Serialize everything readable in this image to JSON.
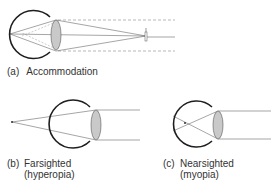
{
  "panels": [
    {
      "id": "a",
      "tag": "(a)",
      "label": "Accommodation",
      "sublabel": "",
      "eye": {
        "cx": 34,
        "cy": 34,
        "r": 24
      },
      "lens": {
        "cx": 56,
        "cy": 35,
        "rx": 5,
        "ry": 15
      },
      "focus_point": {
        "x": 10,
        "y": 34
      },
      "object_point": {
        "x": 146,
        "y": 34
      },
      "description": "Rays from a near object converge on the retina; dashed lines show parallel rays from a distant object"
    },
    {
      "id": "b",
      "tag": "(b)",
      "label": "Farsighted",
      "sublabel": "(hyperopia)",
      "eye": {
        "cx": 73,
        "cy": 124,
        "r": 24
      },
      "lens": {
        "cx": 96,
        "cy": 125,
        "rx": 5,
        "ry": 15
      },
      "focus_point": {
        "x": 12,
        "y": 122
      },
      "description": "Parallel rays focus behind the retina"
    },
    {
      "id": "c",
      "tag": "(c)",
      "label": "Nearsighted",
      "sublabel": "(myopia)",
      "eye": {
        "cx": 195,
        "cy": 124,
        "r": 23
      },
      "lens": {
        "cx": 218,
        "cy": 125,
        "rx": 5,
        "ry": 14
      },
      "focus_point": {
        "x": 185,
        "y": 123
      },
      "description": "Parallel rays focus in front of the retina"
    }
  ],
  "colors": {
    "eye_outline": "#1e1e1e",
    "lens_fill": "#c9c9c9",
    "ray": "#6a6a6a",
    "dashed": "#9a9a9a",
    "text": "#333333"
  }
}
